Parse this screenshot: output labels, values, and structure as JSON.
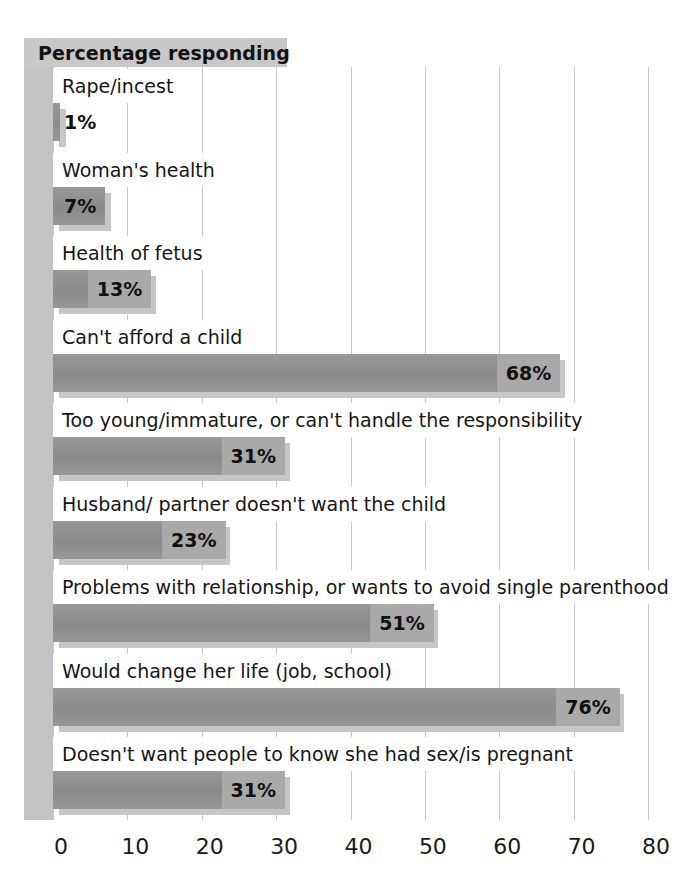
{
  "header": {
    "title": "Percentage responding"
  },
  "chart_data": {
    "type": "bar",
    "orientation": "horizontal",
    "title": "Percentage responding",
    "xlabel": "",
    "ylabel": "",
    "xlim": [
      0,
      80
    ],
    "xticks": [
      "0",
      "10",
      "20",
      "30",
      "40",
      "50",
      "60",
      "70",
      "80"
    ],
    "grid": true,
    "legend": null,
    "value_suffix": "%",
    "categories": [
      "Rape/incest",
      "Woman's health",
      "Health of fetus",
      "Can't afford a child",
      "Too young/immature, or can't handle the responsibility",
      "Husband/ partner doesn't want the child",
      "Problems with relationship, or wants to avoid single parenthood",
      "Would change her life (job, school)",
      "Doesn't want people to know she had sex/is pregnant"
    ],
    "values": [
      1,
      7,
      13,
      68,
      31,
      23,
      51,
      76,
      31
    ],
    "value_labels": [
      "1%",
      "7%",
      "13%",
      "68%",
      "31%",
      "23%",
      "51%",
      "76%",
      "31%"
    ]
  },
  "colors": {
    "bar": "#8f8f8f",
    "bar_shadow": "#c6c6c6",
    "axis_band": "#c3c3c3",
    "header_band": "#c8c8c8",
    "gridline": "#c9c9c9",
    "background": "#ffffff",
    "text": "#161616"
  }
}
